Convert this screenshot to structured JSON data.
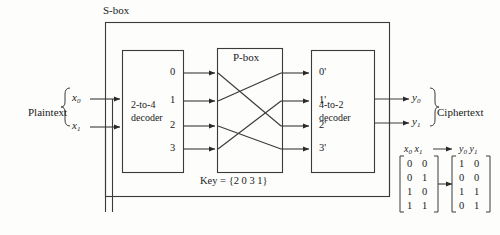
{
  "diagram": {
    "sbox_label": "S-box",
    "pbox_label": "P-box",
    "key_label": "Key = {2 0 3 1}",
    "plaintext_label": "Plaintext",
    "ciphertext_label": "Ciphertext",
    "decoder1": {
      "line1": "2-to-4",
      "line2": "decoder"
    },
    "decoder2": {
      "line1": "4-to-2",
      "line2": "decoder"
    },
    "inputs": [
      {
        "name": "x0",
        "base": "x",
        "sub": "0"
      },
      {
        "name": "x1",
        "base": "x",
        "sub": "1"
      }
    ],
    "outputs": [
      {
        "name": "y0",
        "base": "y",
        "sub": "0"
      },
      {
        "name": "y1",
        "base": "y",
        "sub": "1"
      }
    ],
    "decoder1_outputs": [
      "0",
      "1",
      "2",
      "3"
    ],
    "decoder2_inputs": [
      "0'",
      "1'",
      "2'",
      "3'"
    ],
    "permutation": [
      2,
      0,
      3,
      1
    ]
  },
  "truth_table": {
    "input_header_base": "x",
    "input_header_subs": [
      "0",
      "1"
    ],
    "output_header_base": "y",
    "output_header_subs": [
      "0",
      "1"
    ],
    "arrow": "→",
    "inputs": [
      [
        "0",
        "0"
      ],
      [
        "0",
        "1"
      ],
      [
        "1",
        "0"
      ],
      [
        "1",
        "1"
      ]
    ],
    "outputs": [
      [
        "1",
        "0"
      ],
      [
        "0",
        "0"
      ],
      [
        "1",
        "1"
      ],
      [
        "0",
        "1"
      ]
    ]
  },
  "colors": {
    "ink": "#1a1a1a",
    "line": "#3a3a3a",
    "background": "#fdfdfc"
  }
}
